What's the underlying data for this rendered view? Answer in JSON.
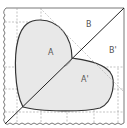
{
  "diagram": {
    "type": "heart-fold-geometry",
    "labels": {
      "a": "A",
      "a_prime": "A'",
      "b": "B",
      "b_prime": "B'"
    },
    "colors": {
      "background": "#ffffff",
      "heart_fill": "#e8e8e8",
      "outline": "#333333",
      "grid": "#9a9a9a",
      "border": "#555555"
    }
  }
}
